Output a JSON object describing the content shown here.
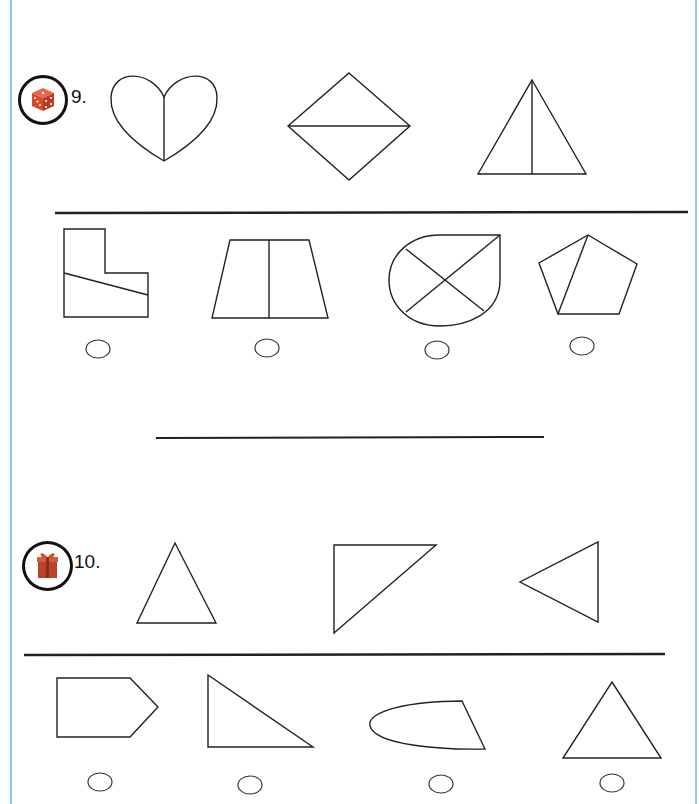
{
  "worksheet": {
    "questions": [
      {
        "number": "9.",
        "badge_icon": "dice-icon",
        "reference_shapes": [
          "heart-halved",
          "rhombus-halved-horizontal",
          "triangle-halved-vertical"
        ],
        "options": [
          {
            "shape": "l-shape-divided-diagonal",
            "selected": false
          },
          {
            "shape": "trapezoid-halved",
            "selected": false
          },
          {
            "shape": "teardrop-quartered",
            "selected": false
          },
          {
            "shape": "pentagon-divided-unequal",
            "selected": false
          }
        ]
      },
      {
        "number": "10.",
        "badge_icon": "gift-icon",
        "reference_shapes": [
          "triangle-isosceles",
          "triangle-right-inverted",
          "triangle-pointing-left"
        ],
        "options": [
          {
            "shape": "pentagon-arrow",
            "selected": false
          },
          {
            "shape": "triangle-right",
            "selected": false
          },
          {
            "shape": "half-ellipse-quad",
            "selected": false
          },
          {
            "shape": "triangle-isosceles",
            "selected": false
          }
        ]
      }
    ],
    "colors": {
      "page_border": "#8cc8f0",
      "dice": "#d9482e",
      "gift": "#b8442a",
      "ink": "#222222"
    }
  }
}
